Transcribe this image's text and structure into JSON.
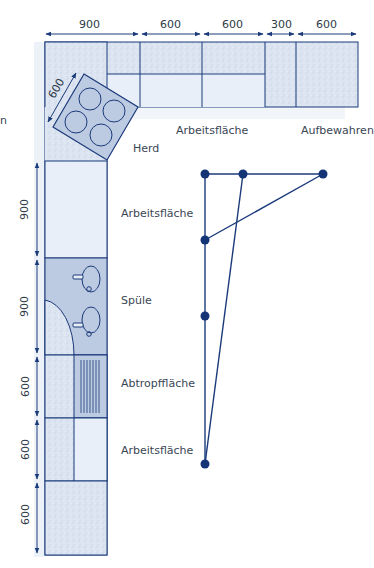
{
  "diagram": {
    "type": "kitchen-floor-plan-L-shape",
    "colors": {
      "line": "#1b3a7a",
      "counter_texture": "#dde6f2",
      "counter_light": "#e9f0f8",
      "appliance_fill": "#bccbe2",
      "node": "#143476",
      "text": "#3a4654"
    },
    "top_dimensions": [
      "900",
      "600",
      "600",
      "300",
      "600"
    ],
    "left_dimensions": [
      "900",
      "900",
      "600",
      "600",
      "600"
    ],
    "diagonal_dimension": "600",
    "labels": {
      "stove": "Herd",
      "worktop_top": "Arbeitsfläche",
      "storage": "Aufbewahren",
      "worktop_left": "Arbeitsfläche",
      "sink": "Spüle",
      "drainboard": "Abtropffläche",
      "worktop_bottom": "Arbeitsfläche",
      "cut_left_edge": "n"
    },
    "workflow_graph": {
      "nodes": [
        {
          "id": "n1",
          "x": 205,
          "y": 174
        },
        {
          "id": "n2",
          "x": 243,
          "y": 174
        },
        {
          "id": "n3",
          "x": 323,
          "y": 174
        },
        {
          "id": "n4",
          "x": 205,
          "y": 240
        },
        {
          "id": "n5",
          "x": 205,
          "y": 316
        },
        {
          "id": "n6",
          "x": 205,
          "y": 464
        }
      ],
      "edges": [
        [
          "n1",
          "n3"
        ],
        [
          "n1",
          "n6"
        ],
        [
          "n2",
          "n6"
        ],
        [
          "n3",
          "n4"
        ]
      ]
    }
  }
}
